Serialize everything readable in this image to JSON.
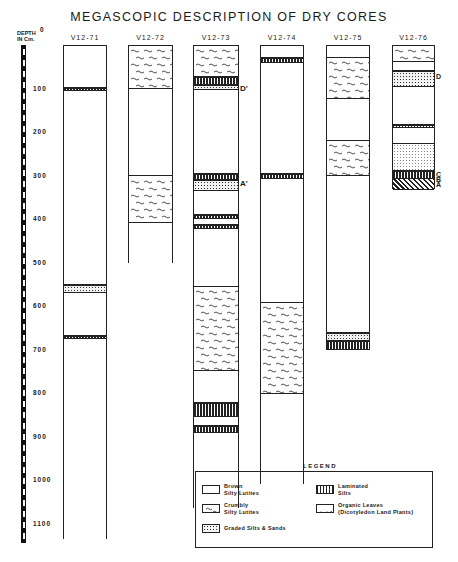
{
  "title": "MEGASCOPIC DESCRIPTION OF DRY CORES",
  "depth_axis": {
    "label_line1": "DEPTH",
    "label_line2": "IN Cm.",
    "ticks": [
      "0",
      "100",
      "200",
      "300",
      "400",
      "500",
      "600",
      "700",
      "800",
      "900",
      "1000",
      "1100"
    ]
  },
  "cores": [
    {
      "name": "V12-71",
      "length_cm": 1135,
      "layers": [
        {
          "type": "brown",
          "from": 0,
          "to": 97
        },
        {
          "type": "laminated",
          "from": 97,
          "to": 103
        },
        {
          "type": "brown",
          "from": 103,
          "to": 550
        },
        {
          "type": "graded",
          "from": 550,
          "to": 568
        },
        {
          "type": "brown",
          "from": 568,
          "to": 667
        },
        {
          "type": "laminated",
          "from": 667,
          "to": 673
        },
        {
          "type": "brown",
          "from": 673,
          "to": 1135
        }
      ]
    },
    {
      "name": "V12-72",
      "length_cm": 500,
      "layers": [
        {
          "type": "crumbly",
          "from": 0,
          "to": 98
        },
        {
          "type": "brown",
          "from": 98,
          "to": 300
        },
        {
          "type": "crumbly",
          "from": 300,
          "to": 407
        },
        {
          "type": "brown",
          "from": 407,
          "to": 500
        }
      ]
    },
    {
      "name": "V12-73",
      "length_cm": 1065,
      "markers": [
        {
          "label": "D'",
          "depth": 100
        },
        {
          "label": "A'",
          "depth": 320
        }
      ],
      "layers": [
        {
          "type": "crumbly",
          "from": 0,
          "to": 72
        },
        {
          "type": "laminated",
          "from": 72,
          "to": 90
        },
        {
          "type": "graded",
          "from": 90,
          "to": 101
        },
        {
          "type": "brown",
          "from": 101,
          "to": 295
        },
        {
          "type": "laminated",
          "from": 295,
          "to": 307
        },
        {
          "type": "graded",
          "from": 307,
          "to": 334
        },
        {
          "type": "brown",
          "from": 334,
          "to": 389
        },
        {
          "type": "laminated",
          "from": 389,
          "to": 398
        },
        {
          "type": "brown",
          "from": 398,
          "to": 412
        },
        {
          "type": "laminated",
          "from": 412,
          "to": 421
        },
        {
          "type": "brown",
          "from": 421,
          "to": 554
        },
        {
          "type": "crumbly",
          "from": 554,
          "to": 747
        },
        {
          "type": "brown",
          "from": 747,
          "to": 821
        },
        {
          "type": "laminated",
          "from": 821,
          "to": 853
        },
        {
          "type": "brown",
          "from": 853,
          "to": 874
        },
        {
          "type": "laminated",
          "from": 874,
          "to": 890
        },
        {
          "type": "brown",
          "from": 890,
          "to": 1065
        }
      ]
    },
    {
      "name": "V12-74",
      "length_cm": 1010,
      "layers": [
        {
          "type": "brown",
          "from": 0,
          "to": 28
        },
        {
          "type": "laminated",
          "from": 28,
          "to": 39
        },
        {
          "type": "brown",
          "from": 39,
          "to": 295
        },
        {
          "type": "laminated",
          "from": 295,
          "to": 306
        },
        {
          "type": "brown",
          "from": 306,
          "to": 591
        },
        {
          "type": "crumbly",
          "from": 591,
          "to": 800
        },
        {
          "type": "brown",
          "from": 800,
          "to": 1010
        }
      ]
    },
    {
      "name": "V12-75",
      "length_cm": 700,
      "layers": [
        {
          "type": "brown",
          "from": 0,
          "to": 28
        },
        {
          "type": "crumbly",
          "from": 28,
          "to": 122
        },
        {
          "type": "brown",
          "from": 122,
          "to": 218
        },
        {
          "type": "crumbly",
          "from": 218,
          "to": 299
        },
        {
          "type": "brown",
          "from": 299,
          "to": 660
        },
        {
          "type": "graded",
          "from": 660,
          "to": 678
        },
        {
          "type": "laminated",
          "from": 678,
          "to": 700
        }
      ]
    },
    {
      "name": "V12-76",
      "length_cm": 330,
      "markers": [
        {
          "label": "D",
          "depth": 75
        },
        {
          "label": "C",
          "depth": 300
        },
        {
          "label": "B",
          "depth": 313
        },
        {
          "label": "A",
          "depth": 325
        }
      ],
      "layers": [
        {
          "type": "crumbly",
          "from": 0,
          "to": 37
        },
        {
          "type": "brown",
          "from": 37,
          "to": 57
        },
        {
          "type": "graded",
          "from": 57,
          "to": 94
        },
        {
          "type": "brown",
          "from": 94,
          "to": 181
        },
        {
          "type": "laminated",
          "from": 181,
          "to": 188
        },
        {
          "type": "brown",
          "from": 188,
          "to": 225
        },
        {
          "type": "graded-light",
          "from": 225,
          "to": 287
        },
        {
          "type": "brown",
          "from": 287,
          "to": 288
        },
        {
          "type": "laminated",
          "from": 288,
          "to": 306
        },
        {
          "type": "organic",
          "from": 306,
          "to": 330
        }
      ]
    }
  ],
  "legend": {
    "title": "LEGEND",
    "items": [
      {
        "type": "brown",
        "line1": "Brown",
        "line2": "Silty Lutites"
      },
      {
        "type": "laminated",
        "line1": "Laminated",
        "line2": "Silts"
      },
      {
        "type": "crumbly",
        "line1": "Crumbly",
        "line2": "Silty Lutites"
      },
      {
        "type": "organic",
        "line1": "Organic Leaves",
        "line2": "(Dicotyledon Land Plants)"
      },
      {
        "type": "graded",
        "line1": "Graded Silts & Sands",
        "line2": ""
      }
    ]
  }
}
